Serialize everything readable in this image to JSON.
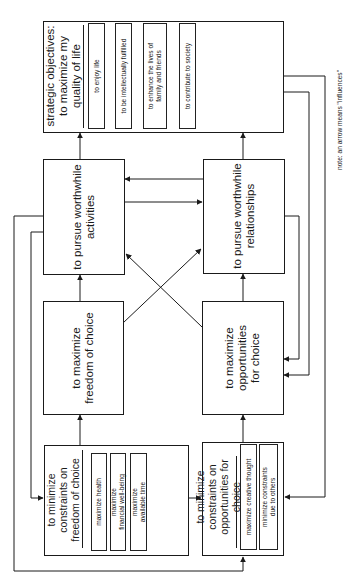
{
  "diagram": {
    "orientation": "rotated 90° counter-clockwise",
    "strategic": {
      "title": "strategic objectives:\nto maximize my\nquality of life",
      "items": [
        "to enjoy life",
        "to be intellectually fulfilled",
        "to enhance the lives of\nfamily and friends",
        "to contribute to society"
      ]
    },
    "activities": {
      "label": "to pursue worthwhile\nactivities"
    },
    "relationships": {
      "label": "to pursue worthwhile\nrelationships"
    },
    "freedom": {
      "label": "to maximize\nfreedom of choice"
    },
    "opportunities": {
      "label": "to maximize\nopportunities\nfor choice"
    },
    "constraints_freedom": {
      "title": "to minimize\nconstraints on\nfreedom of choice",
      "items": [
        "maximize health",
        "maximize\nfinancial well-being",
        "maximize\navailable time"
      ]
    },
    "constraints_opportunities": {
      "title": "to minimize\nconstraints on\nopportunities for choice",
      "items": [
        "maximize creative thought",
        "minimize constraints\ndue to others"
      ]
    },
    "note": "note: an arrow means \"influences\"",
    "edges": [
      {
        "from": "activities",
        "to": "strategic"
      },
      {
        "from": "relationships",
        "to": "strategic"
      },
      {
        "from": "relationships",
        "to": "activities"
      },
      {
        "from": "activities",
        "to": "relationships"
      },
      {
        "from": "freedom",
        "to": "activities"
      },
      {
        "from": "freedom",
        "to": "relationships"
      },
      {
        "from": "opportunities",
        "to": "relationships"
      },
      {
        "from": "opportunities",
        "to": "activities"
      },
      {
        "from": "constraints_freedom",
        "to": "freedom"
      },
      {
        "from": "constraints_opportunities",
        "to": "opportunities"
      },
      {
        "from": "constraints_freedom",
        "to": "constraints_opportunities"
      },
      {
        "from": "activities",
        "to": "constraints_freedom"
      },
      {
        "from": "activities",
        "to": "constraints_opportunities"
      },
      {
        "from": "strategic",
        "to": "opportunities"
      },
      {
        "from": "relationships",
        "to": "opportunities"
      },
      {
        "from": "strategic",
        "to": "constraints_opportunities"
      }
    ]
  }
}
